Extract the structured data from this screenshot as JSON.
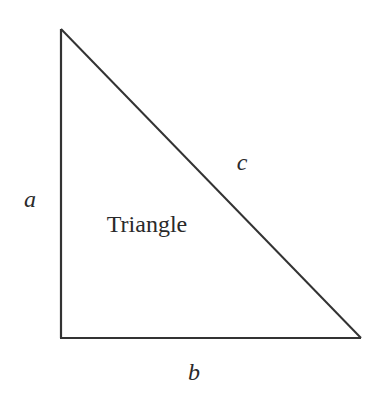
{
  "diagram": {
    "type": "right-triangle",
    "stroke_color": "#333333",
    "background": "#ffffff",
    "vertices": {
      "top": [
        61,
        29
      ],
      "bottom_left": [
        61,
        338
      ],
      "bottom_right": [
        361,
        338
      ]
    },
    "center_label": "Triangle",
    "sides": {
      "a": {
        "label": "a",
        "description": "vertical leg"
      },
      "b": {
        "label": "b",
        "description": "horizontal leg"
      },
      "c": {
        "label": "c",
        "description": "hypotenuse"
      }
    }
  }
}
